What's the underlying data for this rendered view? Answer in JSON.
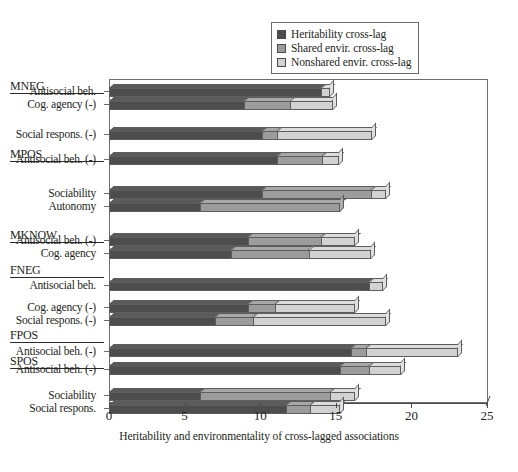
{
  "chart_data": {
    "type": "bar",
    "orientation": "horizontal",
    "stacked": true,
    "title": "",
    "xlabel": "Heritability and environmentality of cross-lagged associations",
    "ylabel": "",
    "xlim": [
      0,
      25
    ],
    "xticks": [
      0,
      5,
      10,
      15,
      20,
      25
    ],
    "grid": false,
    "legend_position": "top-right",
    "series": [
      {
        "name": "Heritability cross-lag",
        "color": "#4d4d4d"
      },
      {
        "name": "Shared envir. cross-lag",
        "color": "#9c9c9c"
      },
      {
        "name": "Nonshared envir. cross-lag",
        "color": "#d2d2d2"
      }
    ],
    "groups": [
      {
        "group": "MNEG",
        "rows": [
          {
            "category": "Antisocial beh.",
            "values": [
              14.0,
              0.0,
              0.6
            ],
            "total": 14.6
          },
          {
            "category": "Cog. agency (-)",
            "values": [
              8.9,
              3.1,
              2.8
            ],
            "total": 14.8
          }
        ]
      },
      {
        "group": "",
        "rows": [
          {
            "category": "Social respons. (-)",
            "values": [
              10.1,
              1.0,
              6.3
            ],
            "total": 17.4
          }
        ]
      },
      {
        "group": "MPOS",
        "rows": [
          {
            "category": "Antisocial beh. (-)",
            "values": [
              11.1,
              3.0,
              1.1
            ],
            "total": 15.2
          }
        ]
      },
      {
        "group": "",
        "rows": [
          {
            "category": "Sociability",
            "values": [
              10.1,
              7.2,
              1.0
            ],
            "total": 18.3
          },
          {
            "category": "Autonomy",
            "values": [
              6.0,
              9.3,
              0.0
            ],
            "total": 15.3
          }
        ]
      },
      {
        "group": "MKNOW",
        "rows": [
          {
            "category": "Antisocial beh. (-)",
            "values": [
              9.2,
              4.8,
              2.3
            ],
            "total": 16.3
          },
          {
            "category": "Cog. agency",
            "values": [
              8.1,
              5.1,
              4.1
            ],
            "total": 17.3
          }
        ]
      },
      {
        "group": "FNEG",
        "rows": [
          {
            "category": "Antisocial beh.",
            "values": [
              17.2,
              0.0,
              0.9
            ],
            "total": 18.1
          }
        ]
      },
      {
        "group": "",
        "rows": [
          {
            "category": "Cog. agency (-)",
            "values": [
              9.2,
              1.8,
              5.3
            ],
            "total": 16.3
          },
          {
            "category": "Social respons. (-)",
            "values": [
              7.0,
              2.5,
              8.8
            ],
            "total": 18.3
          }
        ]
      },
      {
        "group": "FPOS",
        "rows": [
          {
            "category": "Antisocial beh. (-)",
            "values": [
              16.0,
              1.0,
              6.1
            ],
            "total": 23.1
          }
        ]
      },
      {
        "group": "SPOS",
        "rows": [
          {
            "category": "Antisocial beh. (-)",
            "values": [
              15.3,
              1.9,
              2.1
            ],
            "total": 19.3
          }
        ]
      },
      {
        "group": "",
        "rows": [
          {
            "category": "Sociability",
            "values": [
              6.0,
              8.6,
              1.7
            ],
            "total": 16.3
          },
          {
            "category": "Social respons.",
            "values": [
              11.7,
              1.6,
              2.0
            ],
            "total": 15.3
          }
        ]
      }
    ]
  },
  "legend": {
    "items": [
      {
        "label": "Heritability cross-lag",
        "color": "#4d4d4d"
      },
      {
        "label": "Shared envir. cross-lag",
        "color": "#9c9c9c"
      },
      {
        "label": "Nonshared envir. cross-lag",
        "color": "#d2d2d2"
      }
    ]
  },
  "axis": {
    "x_title": "Heritability and environmentality of cross-lagged associations",
    "x_tick_labels": [
      "0",
      "5",
      "10",
      "15",
      "20",
      "25"
    ]
  }
}
